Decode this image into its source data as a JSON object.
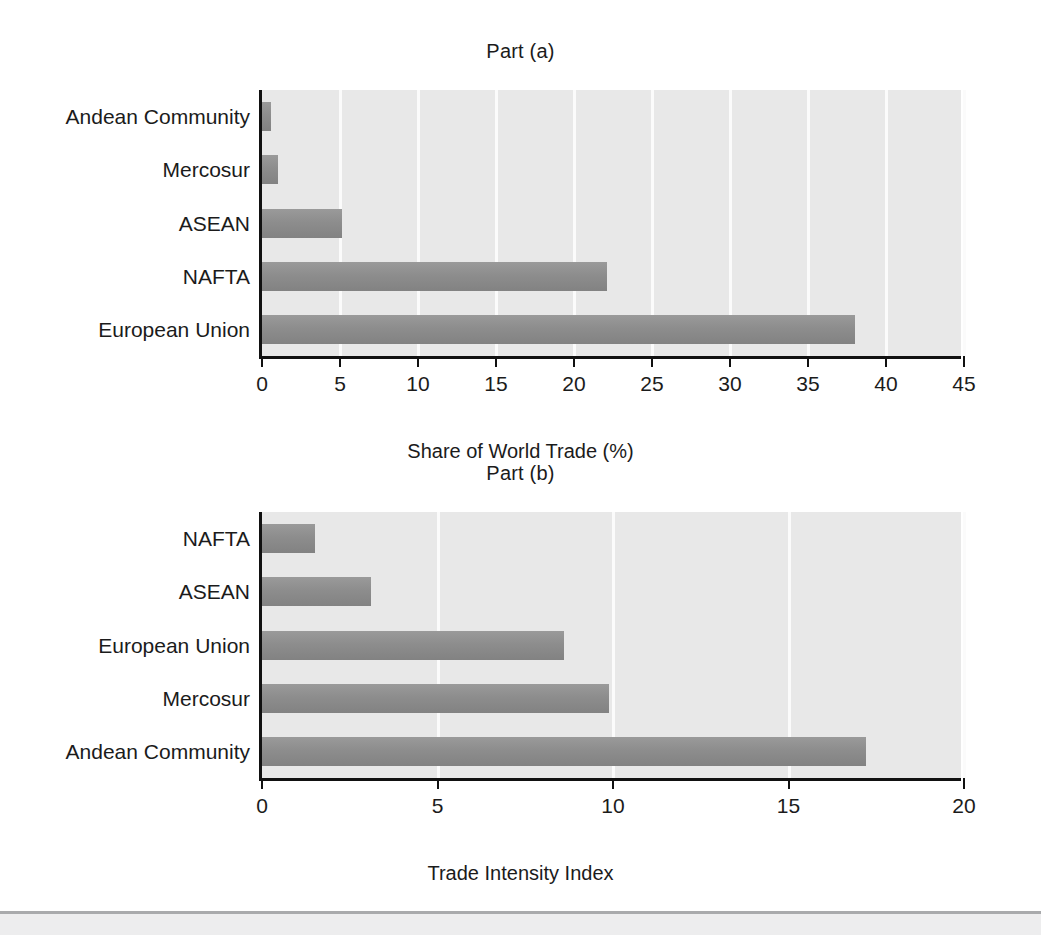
{
  "figure": {
    "background": "#ffffff",
    "plot_background": "#e8e8e8",
    "bar_color": "#8d8d8d",
    "axis_color": "#111111",
    "gridline_color": "#fbfbfb"
  },
  "chart_data": [
    {
      "type": "bar",
      "orientation": "horizontal",
      "title": "Part (a)",
      "xlabel": "Share of World Trade (%)",
      "ylabel": "",
      "categories": [
        "Andean Community",
        "Mercosur",
        "ASEAN",
        "NAFTA",
        "European Union"
      ],
      "values": [
        0.6,
        1.0,
        5.1,
        22.1,
        38.0
      ],
      "xlim": [
        0,
        45
      ],
      "xticks": [
        0,
        5,
        10,
        15,
        20,
        25,
        30,
        35,
        40,
        45
      ],
      "xtick_labels": [
        "0",
        "5",
        "10",
        "15",
        "20",
        "25",
        "30",
        "35",
        "40",
        "45"
      ],
      "grid": true,
      "legend": false
    },
    {
      "type": "bar",
      "orientation": "horizontal",
      "title": "Part (b)",
      "xlabel": "Trade Intensity Index",
      "ylabel": "",
      "categories": [
        "NAFTA",
        "ASEAN",
        "European Union",
        "Mercosur",
        "Andean Community"
      ],
      "values": [
        1.5,
        3.1,
        8.6,
        9.9,
        17.2
      ],
      "xlim": [
        0,
        20
      ],
      "xticks": [
        0,
        5,
        10,
        15,
        20
      ],
      "xtick_labels": [
        "0",
        "5",
        "10",
        "15",
        "20"
      ],
      "grid": true,
      "legend": false
    }
  ]
}
